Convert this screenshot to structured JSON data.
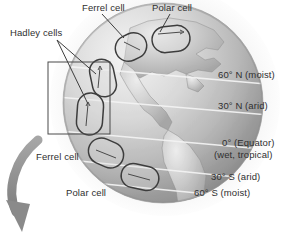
{
  "figure": {
    "kind": "atmospheric-circulation-globe-diagram",
    "background_color": "#ffffff",
    "globe": {
      "continent": "Americas",
      "shading": "grayscale-shaded-sphere",
      "light_source": "upper-left",
      "center_x": 163,
      "center_y": 103,
      "radius": 100,
      "latitude_line_color": "#f2f2f2"
    },
    "rotation_arrow": {
      "name": "earth-rotation-arrow",
      "color": "#8d8d8d",
      "direction": "counterclockwise-sweep-downward"
    },
    "inset_box": {
      "name": "hadley-cells-inset-box",
      "x": 48,
      "y": 62,
      "width": 62,
      "height": 72,
      "stroke": "#4a4a4a"
    }
  },
  "callouts": [
    {
      "id": "ferrel-top",
      "label": "Ferrel cell",
      "x": 82,
      "y": 3,
      "leader": true
    },
    {
      "id": "polar-top",
      "label": "Polar cell",
      "x": 152,
      "y": 3,
      "leader": true
    },
    {
      "id": "hadley",
      "label": "Hadley cells",
      "x": 10,
      "y": 28,
      "leader": true
    },
    {
      "id": "ferrel-bottom",
      "label": "Ferrel cell",
      "x": 36,
      "y": 152,
      "leader": false
    },
    {
      "id": "polar-bottom",
      "label": "Polar cell",
      "x": 66,
      "y": 188,
      "leader": false
    }
  ],
  "latitude_labels": [
    {
      "id": "lat-60n",
      "line1": "60° N (moist)",
      "line2": "",
      "x": 218,
      "y": 70
    },
    {
      "id": "lat-30n",
      "line1": "30° N (arid)",
      "line2": "",
      "x": 218,
      "y": 101
    },
    {
      "id": "lat-0",
      "line1": "0° (Equator)",
      "line2": "(wet, tropical)",
      "x": 222,
      "y": 138
    },
    {
      "id": "lat-30s",
      "line1": "30° S (arid)",
      "line2": "",
      "x": 211,
      "y": 172
    },
    {
      "id": "lat-60s",
      "line1": "60° S (moist)",
      "line2": "",
      "x": 194,
      "y": 188
    }
  ],
  "circulation_cells": [
    {
      "id": "cell-polar-n",
      "name": "polar-cell-north",
      "cx": 171,
      "cy": 39,
      "rx": 19,
      "ry": 13,
      "rot": -6
    },
    {
      "id": "cell-ferrel-n",
      "name": "ferrel-cell-north",
      "cx": 131,
      "cy": 47,
      "rx": 16,
      "ry": 13,
      "rot": -26
    },
    {
      "id": "cell-hadley-n",
      "name": "hadley-cell-north",
      "cx": 103,
      "cy": 78,
      "rx": 12,
      "ry": 19,
      "rot": -12
    },
    {
      "id": "cell-hadley-s",
      "name": "hadley-cell-south",
      "cx": 90,
      "cy": 114,
      "rx": 13,
      "ry": 21,
      "rot": 4
    },
    {
      "id": "cell-ferrel-s",
      "name": "ferrel-cell-south",
      "cx": 106,
      "cy": 153,
      "rx": 18,
      "ry": 13,
      "rot": 24
    },
    {
      "id": "cell-polar-s",
      "name": "polar-cell-south",
      "cx": 140,
      "cy": 177,
      "rx": 19,
      "ry": 12,
      "rot": 12
    }
  ]
}
